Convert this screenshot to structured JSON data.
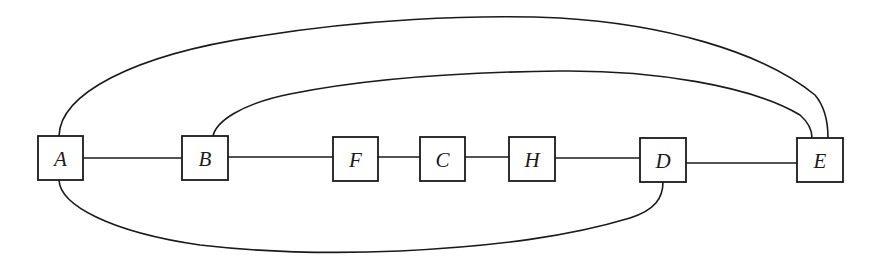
{
  "diagram": {
    "type": "graph",
    "nodes": [
      {
        "id": "A",
        "label": "A",
        "x": 38,
        "y": 136,
        "w": 45,
        "h": 44
      },
      {
        "id": "B",
        "label": "B",
        "x": 182,
        "y": 136,
        "w": 46,
        "h": 44
      },
      {
        "id": "F",
        "label": "F",
        "x": 333,
        "y": 137,
        "w": 45,
        "h": 44
      },
      {
        "id": "C",
        "label": "C",
        "x": 420,
        "y": 137,
        "w": 45,
        "h": 44
      },
      {
        "id": "H",
        "label": "H",
        "x": 509,
        "y": 137,
        "w": 46,
        "h": 44
      },
      {
        "id": "D",
        "label": "D",
        "x": 640,
        "y": 138,
        "w": 46,
        "h": 44
      },
      {
        "id": "E",
        "label": "E",
        "x": 797,
        "y": 138,
        "w": 46,
        "h": 44
      }
    ],
    "edges": [
      {
        "from": "A",
        "to": "B",
        "style": "straight"
      },
      {
        "from": "B",
        "to": "F",
        "style": "straight"
      },
      {
        "from": "F",
        "to": "C",
        "style": "straight"
      },
      {
        "from": "C",
        "to": "H",
        "style": "straight"
      },
      {
        "from": "H",
        "to": "D",
        "style": "straight"
      },
      {
        "from": "D",
        "to": "E",
        "style": "straight"
      },
      {
        "from": "A",
        "to": "E",
        "style": "arc-over"
      },
      {
        "from": "B",
        "to": "E",
        "style": "arc-over"
      },
      {
        "from": "A",
        "to": "D",
        "style": "arc-under"
      }
    ]
  }
}
